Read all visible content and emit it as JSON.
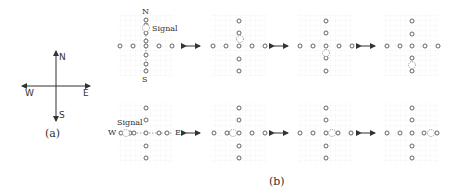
{
  "panel_a": {
    "caption": "(a)",
    "directions": {
      "north": "N",
      "south": "S",
      "west": "W",
      "east": "E"
    }
  },
  "panel_b": {
    "caption": "(b)",
    "signal_label": "Signal",
    "top_row": {
      "axis_labels": {
        "north": "N",
        "south": "S"
      },
      "description": "Signal moving along the vertical (N-S) arm",
      "frames": [
        {
          "signal_position": "north, between 2nd and 3rd node from top"
        },
        {
          "signal_position": "just north of center"
        },
        {
          "signal_position": "just south of center"
        },
        {
          "signal_position": "south, between 4th and 5th node"
        }
      ]
    },
    "bottom_row": {
      "axis_labels": {
        "west": "W",
        "east": "E"
      },
      "description": "Signal moving along the horizontal (W-E) arm",
      "frames": [
        {
          "signal_position": "far west"
        },
        {
          "signal_position": "just west of center"
        },
        {
          "signal_position": "just east of center"
        },
        {
          "signal_position": "far east"
        }
      ]
    }
  },
  "colors": {
    "node": "#555555",
    "signal": "#777777",
    "arrow": "#333333",
    "grid": "#eeeeee"
  }
}
